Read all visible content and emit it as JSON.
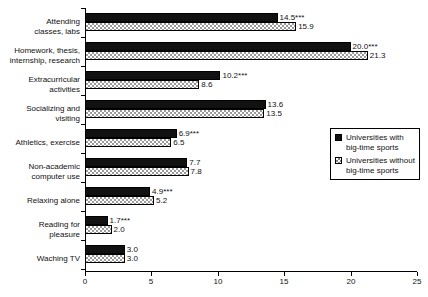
{
  "chart_data": {
    "type": "bar",
    "orientation": "horizontal",
    "title": "",
    "subtitle": "",
    "xlabel": "",
    "ylabel": "",
    "xlim": [
      0,
      25
    ],
    "xticks": [
      "0",
      "5",
      "10",
      "15",
      "20",
      "25"
    ],
    "grid": false,
    "legend_position": "right-middle",
    "categories": [
      "Attending\nclasses, labs",
      "Homework, thesis,\ninternship, research",
      "Extracurricular\nactivities",
      "Socializing and\nvisiting",
      "Athletics, exercise",
      "Non-academic\ncomputer use",
      "Relaxing alone",
      "Reading for\npleasure",
      "Waching TV"
    ],
    "series": [
      {
        "name": "Universities with\nbig-time sports",
        "style": "solid-black",
        "values": [
          14.5,
          20.0,
          10.2,
          13.6,
          6.9,
          7.7,
          4.9,
          1.7,
          3.0
        ],
        "labels": [
          "14.5***",
          "20.0***",
          "10.2***",
          "13.6",
          "6.9***",
          "7.7",
          "4.9***",
          "1.7***",
          "3.0"
        ]
      },
      {
        "name": "Universities without\nbig-time sports",
        "style": "checker-pattern",
        "values": [
          15.9,
          21.3,
          8.6,
          13.5,
          6.5,
          7.8,
          5.2,
          2.0,
          3.0
        ],
        "labels": [
          "15.9",
          "21.3",
          "8.6",
          "13.5",
          "6.5",
          "7.8",
          "5.2",
          "2.0",
          "3.0"
        ]
      }
    ]
  },
  "legend": {
    "entries": [
      {
        "label": "Universities with\nbig-time sports",
        "swatch": "solid-black"
      },
      {
        "label": "Universities without\nbig-time sports",
        "swatch": "checker-pattern"
      }
    ]
  },
  "colors": {
    "series_1": "#111111",
    "series_2_pattern": "#9a9a9a",
    "axis": "#000000",
    "background": "#ffffff",
    "text": "#111111"
  }
}
